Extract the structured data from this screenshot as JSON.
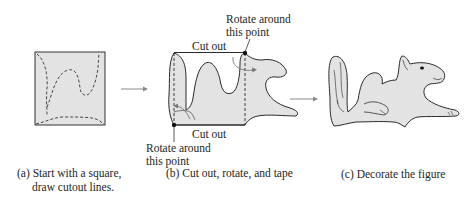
{
  "panels": [
    {
      "id": "a",
      "caption_line1": "(a) Start with a square,",
      "caption_line2": "draw cutout lines."
    },
    {
      "id": "b",
      "caption_line1": "(b) Cut out, rotate, and tape"
    },
    {
      "id": "c",
      "caption_line1": "(c) Decorate the figure"
    }
  ],
  "panel_b": {
    "top_cut_label": "Cut out",
    "bottom_cut_label": "Cut out",
    "top_rotate_label_line1": "Rotate around",
    "top_rotate_label_line2": "this point",
    "bottom_rotate_label_line1": "Rotate around",
    "bottom_rotate_label_line2": "this point"
  },
  "colors": {
    "fill": "#e3e3e3",
    "stroke": "#2b2b2b",
    "arrow": "#8a8a8a",
    "text": "#231f20"
  }
}
